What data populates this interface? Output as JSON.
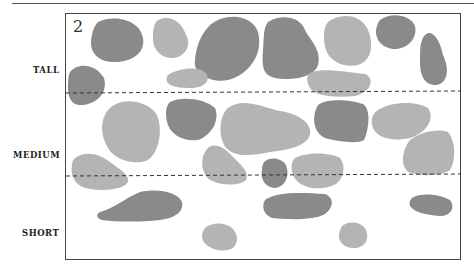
{
  "figure": {
    "number": "2",
    "categories": [
      {
        "label": "TALL"
      },
      {
        "label": "MEDIUM"
      },
      {
        "label": "SHORT"
      }
    ],
    "colors": {
      "dark": "#8a8a8a",
      "light": "#b4b4b4",
      "frame": "#444444",
      "divider": "#333333"
    },
    "dividers_y": [
      93,
      175
    ]
  }
}
